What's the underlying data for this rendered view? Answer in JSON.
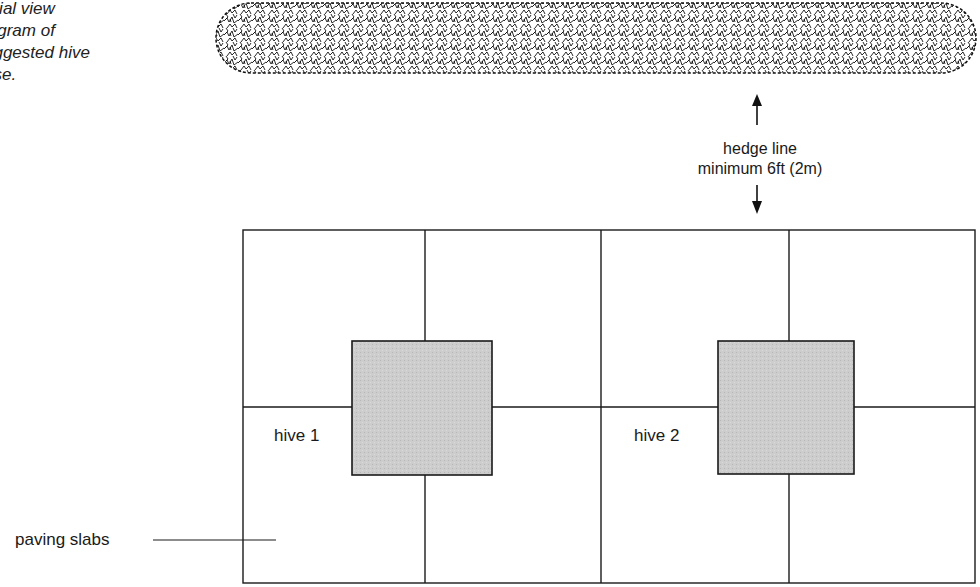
{
  "caption": {
    "lines": [
      "erial view",
      "iagram of",
      "uggested hive",
      "ase."
    ],
    "full_text_visible": "erial view / iagram of / uggested hive / ase."
  },
  "hedge": {
    "label_line1": "hedge line",
    "label_line2": "minimum 6ft (2m)",
    "arrow_up_icon": "arrow-up-icon",
    "arrow_down_icon": "arrow-down-icon"
  },
  "hives": [
    {
      "label": "hive 1",
      "fill": "#cfcfcf"
    },
    {
      "label": "hive 2",
      "fill": "#cfcfcf"
    }
  ],
  "paving": {
    "label": "paving slabs",
    "grid_rows": 2,
    "grid_cols": 4
  },
  "colors": {
    "line": "#1a1a1a",
    "hedge": "#111111",
    "hive_fill": "#cdcdcd",
    "background": "#ffffff"
  }
}
